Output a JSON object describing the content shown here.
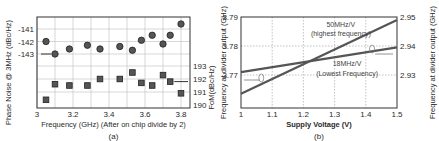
{
  "chart_data": [
    {
      "type": "scatter",
      "panel": "(a)",
      "caption": "(a)",
      "title": "",
      "xlabel": "Frequency (GHz) (After on chip divide by 2)",
      "ylabel_left": "Phase Noise @ 3MHz (dBc/Hz)",
      "ylabel_right": "FoM(dBc/Hz)",
      "x_ticks": [
        "3",
        "3.2",
        "3.4",
        "3.6",
        "3.8"
      ],
      "y_left_ticks": [
        "-141",
        "-142",
        "-143"
      ],
      "y_right_ticks": [
        "193",
        "192",
        "191",
        "190"
      ],
      "xlim": [
        3.0,
        3.85
      ],
      "grid": true,
      "series": [
        {
          "name": "Phase Noise",
          "marker": "circle",
          "axis": "left",
          "x": [
            3.05,
            3.1,
            3.18,
            3.28,
            3.35,
            3.46,
            3.53,
            3.58,
            3.64,
            3.7,
            3.74,
            3.8
          ],
          "values": [
            -142.0,
            -143.0,
            -142.6,
            -142.3,
            -142.6,
            -142.4,
            -142.7,
            -141.9,
            -141.5,
            -142.2,
            -141.5,
            -140.6
          ]
        },
        {
          "name": "FoM",
          "marker": "square",
          "axis": "right",
          "x": [
            3.05,
            3.1,
            3.18,
            3.28,
            3.35,
            3.46,
            3.53,
            3.58,
            3.64,
            3.7,
            3.74,
            3.8
          ],
          "values": [
            190.4,
            191.6,
            191.5,
            191.5,
            192.0,
            192.0,
            192.5,
            191.7,
            191.5,
            192.3,
            191.8,
            190.9
          ]
        }
      ]
    },
    {
      "type": "line",
      "panel": "(b)",
      "caption": "(b)",
      "title": "",
      "xlabel": "Supply Voltage (V)",
      "ylabel_left": "Frequency at divider output (GHz)",
      "ylabel_right": "Frequency at divider output (GHz)",
      "x_ticks": [
        "1",
        "1.1",
        "1.2",
        "1.3",
        "1.4",
        "1.5"
      ],
      "y_left_ticks": [
        "3.79",
        "3.78",
        "3.77"
      ],
      "y_right_ticks": [
        "2.95",
        "2.94",
        "2.93"
      ],
      "xlim": [
        1.0,
        1.5
      ],
      "ylim_left": [
        3.761,
        3.79
      ],
      "ylim_right": [
        2.921,
        2.95
      ],
      "grid": true,
      "annotations": [
        "50MHz/V",
        "(highest frequency)",
        "18MHz/V",
        "(Lowest Frequency)"
      ],
      "series": [
        {
          "name": "50MHz/V (highest frequency)",
          "axis": "left",
          "x": [
            1.0,
            1.5
          ],
          "values": [
            3.7635,
            3.789
          ]
        },
        {
          "name": "18MHz/V (Lowest Frequency)",
          "axis": "right",
          "x": [
            1.0,
            1.5
          ],
          "values": [
            2.931,
            2.9395
          ]
        }
      ]
    }
  ]
}
